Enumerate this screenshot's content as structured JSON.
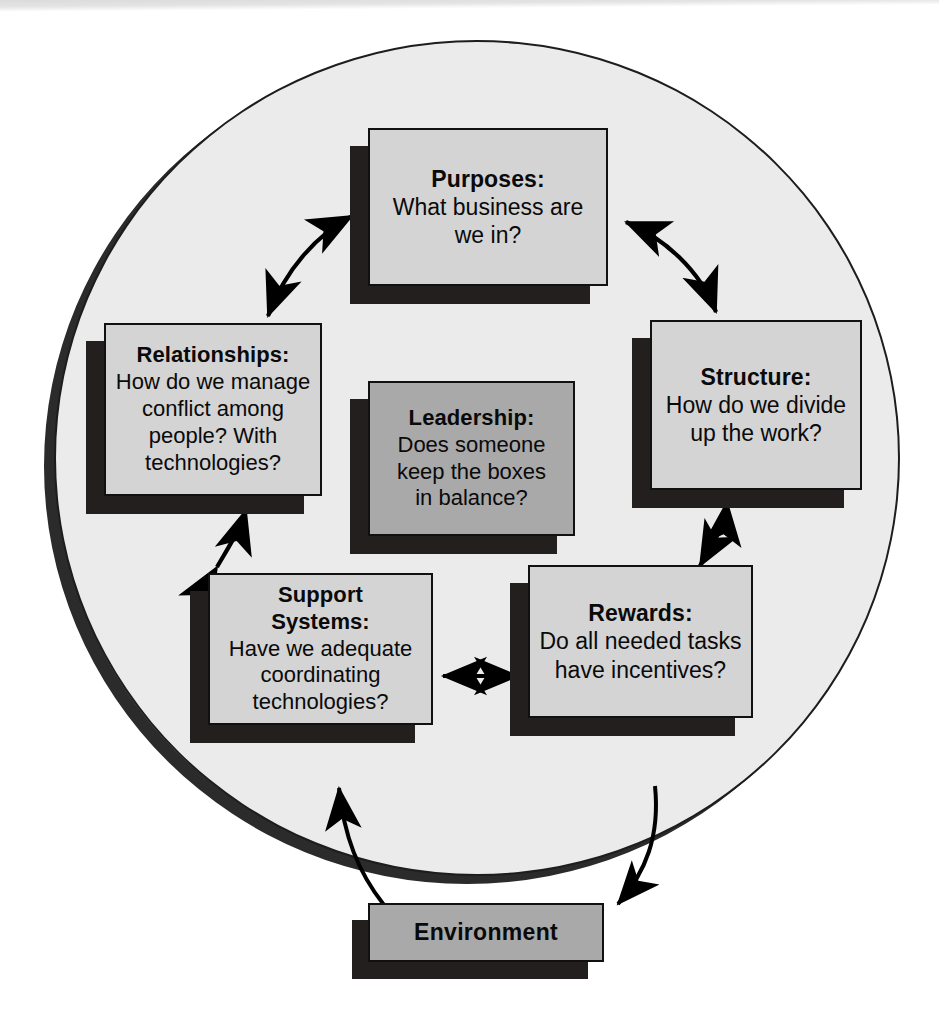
{
  "diagram": {
    "colors": {
      "circle_fill": "#ebebeb",
      "circle_outline": "#1d1d1d",
      "circle_shadow": "#2b2b2b",
      "box_fill": "#d4d4d4",
      "box_fill_accent": "#a9a9a9",
      "box_outline": "#111111",
      "box_shadow": "#231f1f",
      "arrow": "#000000",
      "page_background": "#ffffff"
    },
    "boxes": {
      "purposes": {
        "title": "Purposes:",
        "lines": [
          "What business are",
          "we in?"
        ]
      },
      "structure": {
        "title": "Structure:",
        "lines": [
          "How do we divide",
          "up the work?"
        ]
      },
      "relationships": {
        "title": "Relationships:",
        "lines": [
          "How do we manage",
          "conflict among",
          "people? With",
          "technologies?"
        ]
      },
      "leadership": {
        "title": "Leadership:",
        "lines": [
          "Does someone",
          "keep the boxes",
          "in balance?"
        ]
      },
      "support_systems": {
        "title_lines": [
          "Support",
          "Systems:"
        ],
        "lines": [
          "Have we adequate",
          "coordinating",
          "technologies?"
        ]
      },
      "rewards": {
        "title": "Rewards:",
        "lines": [
          "Do all needed tasks",
          "have incentives?"
        ]
      },
      "environment": {
        "title": "Environment"
      }
    },
    "connectors": [
      {
        "name": "relationships-purposes",
        "heads": "double",
        "style": "curved"
      },
      {
        "name": "purposes-structure",
        "heads": "double",
        "style": "curved"
      },
      {
        "name": "structure-rewards",
        "heads": "double",
        "style": "curved"
      },
      {
        "name": "support-rewards",
        "heads": "double",
        "style": "straight"
      },
      {
        "name": "relationships-support",
        "heads": "double",
        "style": "curved"
      },
      {
        "name": "environment-to-circle",
        "heads": "single",
        "style": "curved"
      },
      {
        "name": "circle-to-environment",
        "heads": "single",
        "style": "curved"
      }
    ]
  }
}
